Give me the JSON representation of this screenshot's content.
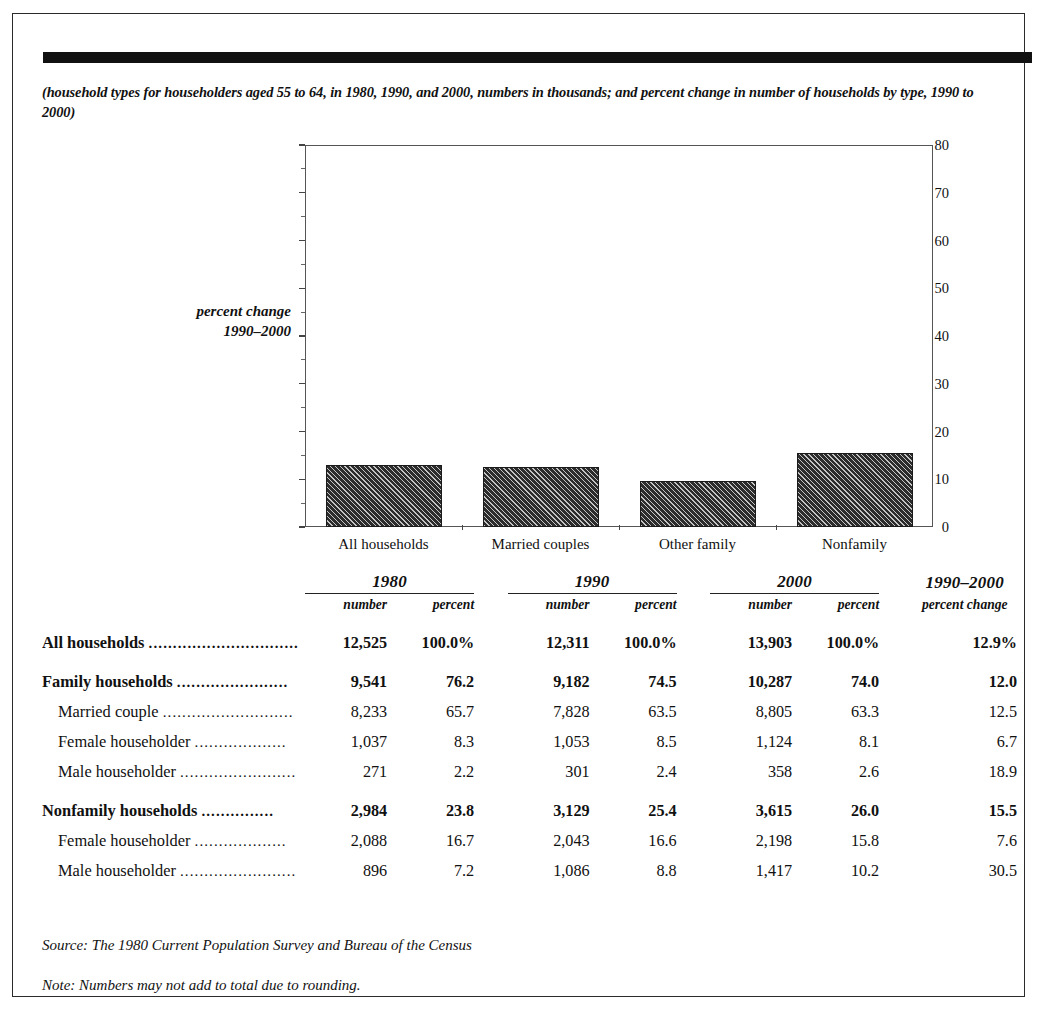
{
  "subtitle": "(household types for householders aged 55 to 64, in 1980, 1990, and 2000, numbers in thousands; and percent change in number of households by type, 1990 to 2000)",
  "chart_data": {
    "type": "bar",
    "title": "",
    "xlabel": "",
    "ylabel": "percent change 1990–2000",
    "ylabel_line1": "percent change",
    "ylabel_line2": "1990–2000",
    "categories": [
      "All households",
      "Married couples",
      "Other family",
      "Nonfamily"
    ],
    "values": [
      12.9,
      12.5,
      9.7,
      15.5
    ],
    "ylim": [
      0,
      80
    ],
    "ytick_labels": [
      "0",
      "10",
      "20",
      "30",
      "40",
      "50",
      "60",
      "70",
      "80"
    ],
    "ytick_values": [
      0,
      10,
      20,
      30,
      40,
      50,
      60,
      70,
      80
    ],
    "yminor_values": [
      5,
      15,
      25,
      35,
      45,
      55,
      65,
      75
    ],
    "grid": false,
    "legend": "none",
    "bar_fill": "#2c2c2c",
    "bar_pattern": "diagonal-hatch"
  },
  "table": {
    "group_headers": [
      "1980",
      "1990",
      "2000",
      "1990–2000"
    ],
    "sub_headers": {
      "number": "number",
      "percent": "percent",
      "percent_change": "percent change"
    },
    "rows": [
      {
        "label": "All households",
        "leader": "...............................",
        "bold": true,
        "indent": false,
        "spacer": false,
        "v1980_number": "12,525",
        "v1980_percent": "100.0%",
        "v1990_number": "12,311",
        "v1990_percent": "100.0%",
        "v2000_number": "13,903",
        "v2000_percent": "100.0%",
        "change": "12.9%"
      },
      {
        "label": "Family households",
        "leader": ".......................",
        "bold": true,
        "indent": false,
        "spacer": true,
        "v1980_number": "9,541",
        "v1980_percent": "76.2",
        "v1990_number": "9,182",
        "v1990_percent": "74.5",
        "v2000_number": "10,287",
        "v2000_percent": "74.0",
        "change": "12.0"
      },
      {
        "label": "Married couple",
        "leader": "...........................",
        "bold": false,
        "indent": true,
        "spacer": false,
        "v1980_number": "8,233",
        "v1980_percent": "65.7",
        "v1990_number": "7,828",
        "v1990_percent": "63.5",
        "v2000_number": "8,805",
        "v2000_percent": "63.3",
        "change": "12.5"
      },
      {
        "label": "Female householder",
        "leader": "...................",
        "bold": false,
        "indent": true,
        "spacer": false,
        "v1980_number": "1,037",
        "v1980_percent": "8.3",
        "v1990_number": "1,053",
        "v1990_percent": "8.5",
        "v2000_number": "1,124",
        "v2000_percent": "8.1",
        "change": "6.7"
      },
      {
        "label": "Male householder",
        "leader": "........................",
        "bold": false,
        "indent": true,
        "spacer": false,
        "v1980_number": "271",
        "v1980_percent": "2.2",
        "v1990_number": "301",
        "v1990_percent": "2.4",
        "v2000_number": "358",
        "v2000_percent": "2.6",
        "change": "18.9"
      },
      {
        "label": "Nonfamily households",
        "leader": "...............",
        "bold": true,
        "indent": false,
        "spacer": true,
        "v1980_number": "2,984",
        "v1980_percent": "23.8",
        "v1990_number": "3,129",
        "v1990_percent": "25.4",
        "v2000_number": "3,615",
        "v2000_percent": "26.0",
        "change": "15.5"
      },
      {
        "label": "Female householder",
        "leader": "...................",
        "bold": false,
        "indent": true,
        "spacer": false,
        "v1980_number": "2,088",
        "v1980_percent": "16.7",
        "v1990_number": "2,043",
        "v1990_percent": "16.6",
        "v2000_number": "2,198",
        "v2000_percent": "15.8",
        "change": "7.6"
      },
      {
        "label": "Male householder",
        "leader": "........................",
        "bold": false,
        "indent": true,
        "spacer": false,
        "v1980_number": "896",
        "v1980_percent": "7.2",
        "v1990_number": "1,086",
        "v1990_percent": "8.8",
        "v2000_number": "1,417",
        "v2000_percent": "10.2",
        "change": "30.5"
      }
    ]
  },
  "footer": {
    "source": "Source: The 1980 Current Population Survey and Bureau of the Census",
    "note": "Note: Numbers may not add to total due to rounding."
  }
}
